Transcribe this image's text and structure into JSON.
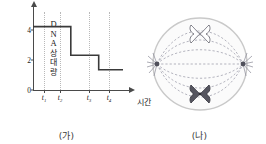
{
  "figure": {
    "panels": [
      {
        "id": "a",
        "caption": "(가)"
      },
      {
        "id": "b",
        "caption": "(나)"
      }
    ]
  },
  "chart_data": {
    "type": "line",
    "subtype": "step",
    "title": "",
    "xlabel": "시간",
    "ylabel": "DNA 상대량",
    "ylabel_lines": [
      "D",
      "N",
      "A",
      "상",
      "대",
      "량"
    ],
    "yticks": [
      0,
      2,
      4
    ],
    "ylim": [
      0,
      4.6
    ],
    "xticks": [
      "t1",
      "t2",
      "t3",
      "t4"
    ],
    "xtick_labels": [
      "t₁",
      "t₂",
      "t₃",
      "t₄"
    ],
    "xtick_positions": [
      0.12,
      0.3,
      0.62,
      0.84
    ],
    "grid": false,
    "guides": "dotted-vertical-at-xticks",
    "x": [
      0.0,
      0.42,
      0.42,
      0.73,
      0.73,
      1.0
    ],
    "y": [
      4,
      4,
      2,
      2,
      1,
      1
    ],
    "steps": [
      {
        "from_x": 0.0,
        "to_x": 0.42,
        "value": 4
      },
      {
        "from_x": 0.42,
        "to_x": 0.73,
        "value": 2
      },
      {
        "from_x": 0.73,
        "to_x": 1.0,
        "value": 1
      }
    ],
    "line_color": "#3a3a3a",
    "axis_color": "#4a4a4a",
    "guide_color": "#b9b9b9"
  },
  "cell_diagram": {
    "description": "세포 분열 중기 모식도",
    "membrane_color": "#c9c9c9",
    "membrane_fill": "#fbfbfb",
    "spindle_color": "#9a9aa6",
    "pole_color": "#555560",
    "chromosomes": [
      {
        "id": "upper",
        "style": "outline",
        "fill": "#ffffff",
        "stroke": "#6f6f78"
      },
      {
        "id": "lower",
        "style": "solid",
        "fill": "#55555f",
        "stroke": "#3c3c45"
      }
    ],
    "poles": [
      {
        "id": "left-pole",
        "position": "left"
      },
      {
        "id": "right-pole",
        "position": "right"
      }
    ]
  }
}
